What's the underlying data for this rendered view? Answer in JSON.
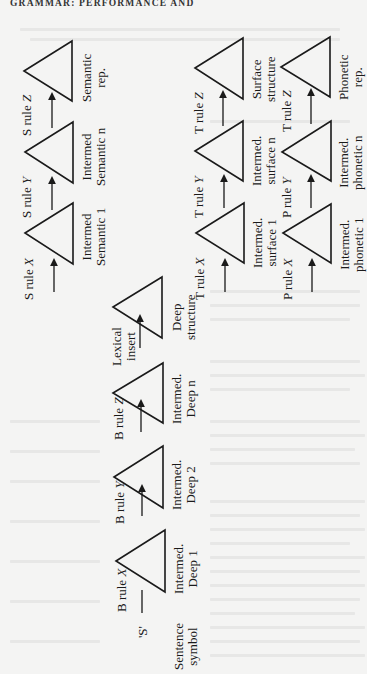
{
  "page": {
    "running_head": "GRAMMAR: PERFORMANCE AND",
    "orientation": "rotated 90° counter-clockwise",
    "colors": {
      "paper": "#f4f4f3",
      "ink": "#1a1a1a",
      "bleed_through": "#dcdcdb"
    }
  },
  "diagram": {
    "rows": [
      {
        "id": "semantic",
        "rules": [
          {
            "prefix": "S rule ",
            "var": "X"
          },
          {
            "prefix": "S rule ",
            "var": "Y"
          },
          {
            "prefix": "S rule ",
            "var": "Z"
          }
        ],
        "nodes": [
          {
            "line1": "Intermed",
            "line2": "Semantic 1"
          },
          {
            "line1": "Intermed",
            "line2": "Semantic n"
          },
          {
            "line1": "Semantic",
            "line2": "rep."
          }
        ]
      },
      {
        "id": "base",
        "start": {
          "symbol": "'S'",
          "line1": "Sentence",
          "line2": "symbol"
        },
        "rules": [
          {
            "prefix": "B rule ",
            "var": "X"
          },
          {
            "prefix": "B rule ",
            "var": "Y"
          },
          {
            "prefix": "B rule ",
            "var": "Z"
          },
          {
            "line1": "Lexical",
            "line2": "insert"
          }
        ],
        "nodes": [
          {
            "line1": "Intermed.",
            "line2": "Deep 1"
          },
          {
            "line1": "Intermed.",
            "line2": "Deep 2"
          },
          {
            "line1": "Intermed.",
            "line2": "Deep n"
          },
          {
            "line1": "Deep",
            "line2": "structure"
          }
        ]
      },
      {
        "id": "transformational",
        "rules": [
          {
            "prefix": "T rule ",
            "var": "X"
          },
          {
            "prefix": "T rule ",
            "var": "Y"
          },
          {
            "prefix": "T rule ",
            "var": "Z"
          }
        ],
        "nodes": [
          {
            "line1": "Intermed.",
            "line2": "surface 1"
          },
          {
            "line1": "Intermed.",
            "line2": "surface n"
          },
          {
            "line1": "Surface",
            "line2": "structure"
          }
        ]
      },
      {
        "id": "phonological",
        "rules": [
          {
            "prefix": "P rule ",
            "var": "X"
          },
          {
            "prefix": "P rule ",
            "var": "Y"
          },
          {
            "prefix": "T rule ",
            "var": "Z"
          }
        ],
        "nodes": [
          {
            "line1": "Intermed.",
            "line2": "phonetic 1"
          },
          {
            "line1": "Intermed.",
            "line2": "phonetic n"
          },
          {
            "line1": "Phonetic",
            "line2": "rep."
          }
        ]
      }
    ]
  }
}
